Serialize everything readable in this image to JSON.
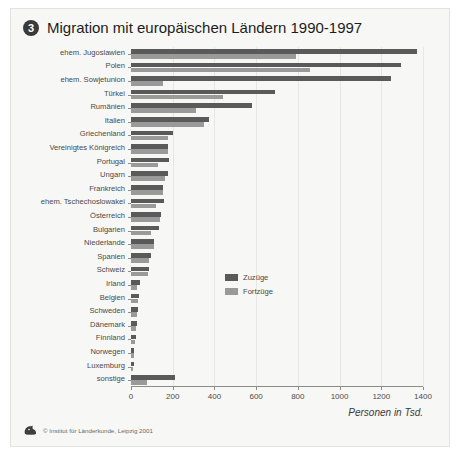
{
  "figure": {
    "badge": "3",
    "title": "Migration mit europäischen Ländern 1990-1997",
    "credit": "© Institut für Länderkunde, Leipzig 2001",
    "logo_icon": "institute-logo-icon"
  },
  "chart_data": {
    "type": "bar",
    "orientation": "horizontal",
    "title": "Migration mit europäischen Ländern 1990-1997",
    "xlabel": "Personen in Tsd.",
    "ylabel": "",
    "xlim": [
      0,
      1400
    ],
    "xticks": [
      0,
      200,
      400,
      600,
      800,
      1000,
      1200,
      1400
    ],
    "grid": true,
    "legend_position": "center-right",
    "colors": {
      "zuzuege": "#5a5a5a",
      "fortzuege": "#9a9a9a"
    },
    "categories": [
      "ehem. Jugoslawien",
      "Polen",
      "ehem. Sowjetunion",
      "Türkei",
      "Rumänien",
      "Italien",
      "Griechenland",
      "Vereinigtes Königreich",
      "Portugal",
      "Ungarn",
      "Frankreich",
      "ehem. Tschechoslowakei",
      "Österreich",
      "Bulgarien",
      "Niederlande",
      "Spanien",
      "Schweiz",
      "Irland",
      "Belgien",
      "Schweden",
      "Dänemark",
      "Finnland",
      "Norwegen",
      "Luxemburg",
      "sonstige"
    ],
    "series": [
      {
        "name": "Zuzüge",
        "values": [
          1370,
          1295,
          1245,
          690,
          580,
          375,
          200,
          178,
          182,
          175,
          155,
          160,
          145,
          135,
          110,
          95,
          85,
          45,
          38,
          32,
          28,
          22,
          15,
          12,
          210
        ]
      },
      {
        "name": "Fortzüge",
        "values": [
          790,
          860,
          155,
          440,
          310,
          350,
          178,
          175,
          130,
          165,
          152,
          120,
          140,
          95,
          110,
          85,
          80,
          30,
          35,
          30,
          25,
          18,
          14,
          11,
          75
        ]
      }
    ]
  }
}
